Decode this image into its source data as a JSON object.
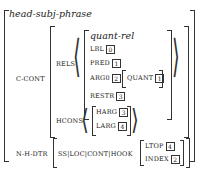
{
  "avm": {
    "type": "head-subj-phrase",
    "c_cont": {
      "label": "C-CONT",
      "rels": {
        "label": "RELS",
        "type": "quant-rel",
        "lbl": {
          "attr": "LBL",
          "tag": "0"
        },
        "pred": {
          "attr": "PRED",
          "tag": "1"
        },
        "arg0": {
          "attr": "ARG0",
          "tag": "2",
          "inner_attr": "QUANT",
          "inner_tag": "1"
        },
        "restr": {
          "attr": "RESTR",
          "tag": "3"
        }
      },
      "hcons": {
        "label": "HCONS",
        "harg": {
          "attr": "HARG",
          "tag": "3"
        },
        "larg": {
          "attr": "LARG",
          "tag": "4"
        }
      }
    },
    "n_h_dtr": {
      "label": "N-H-DTR",
      "path": "SS|LOC|CONT|HOOK",
      "ltop": {
        "attr": "LTOP",
        "tag": "4"
      },
      "index": {
        "attr": "INDEX",
        "tag": "2"
      }
    }
  }
}
